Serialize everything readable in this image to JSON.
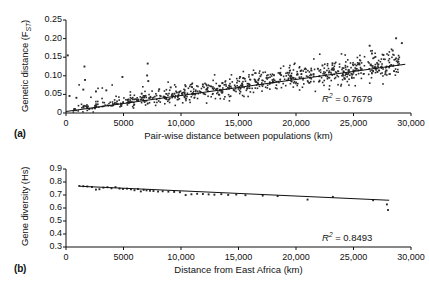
{
  "figure": {
    "panel_a_tag": "(a)",
    "panel_b_tag": "(b)"
  },
  "chart_data": [
    {
      "id": "panel-a",
      "type": "scatter",
      "title": "",
      "xlabel": "Pair-wise distance between populations (km)",
      "ylabel": "Genetic distance (FST)",
      "ylabel_main": "Genetic distance (F",
      "ylabel_sub": "ST",
      "ylabel_tail": ")",
      "xlim": [
        0,
        30000
      ],
      "ylim": [
        0,
        0.25
      ],
      "grid": false,
      "xticks": [
        0,
        5000,
        10000,
        15000,
        20000,
        25000,
        30000
      ],
      "xticklabels": [
        "0",
        "5000",
        "10,000",
        "15,000",
        "20,000",
        "25,000",
        "30,000"
      ],
      "yticks": [
        0,
        0.05,
        0.1,
        0.15,
        0.2,
        0.25
      ],
      "yticklabels": [
        "0",
        "0.05",
        "0.10",
        "0.15",
        "0.20",
        "0.25"
      ],
      "annotation": "R2 = 0.7679",
      "annotation_symbol": "R",
      "annotation_sup": "2",
      "annotation_value": " = 0.7679",
      "r_squared": 0.7679,
      "marker_color": "#2a2a2a",
      "line_color": "#111111",
      "trend": {
        "intercept": 0.004,
        "slope": 4.3e-06,
        "x_start": 0,
        "x_end": 29500
      },
      "n_points": 820,
      "point_spread": 0.016,
      "outliers": [
        [
          150,
          0.155
        ],
        [
          1600,
          0.125
        ],
        [
          1650,
          0.089
        ],
        [
          1500,
          0.063
        ],
        [
          4900,
          0.097
        ],
        [
          7100,
          0.133
        ],
        [
          7050,
          0.101
        ],
        [
          7150,
          0.086
        ],
        [
          2600,
          0.058
        ],
        [
          3500,
          0.061
        ],
        [
          300,
          0.046
        ],
        [
          900,
          0.041
        ],
        [
          26400,
          0.181
        ],
        [
          28700,
          0.201
        ],
        [
          29200,
          0.188
        ],
        [
          28400,
          0.168
        ],
        [
          26600,
          0.16
        ],
        [
          27600,
          0.156
        ],
        [
          26900,
          0.151
        ],
        [
          28900,
          0.145
        ],
        [
          22300,
          0.128
        ],
        [
          21900,
          0.119
        ],
        [
          20400,
          0.113
        ],
        [
          24500,
          0.104
        ],
        [
          18700,
          0.102
        ],
        [
          16900,
          0.099
        ],
        [
          15400,
          0.094
        ],
        [
          13600,
          0.081
        ],
        [
          11900,
          0.077
        ],
        [
          10400,
          0.072
        ],
        [
          9100,
          0.069
        ],
        [
          8100,
          0.064
        ]
      ]
    },
    {
      "id": "panel-b",
      "type": "scatter",
      "title": "",
      "xlabel": "Distance from East Africa (km)",
      "ylabel": "Gene diversity (Hs)",
      "xlim": [
        0,
        30000
      ],
      "ylim": [
        0.3,
        0.9
      ],
      "grid": false,
      "xticks": [
        0,
        5000,
        10000,
        15000,
        20000,
        25000,
        30000
      ],
      "xticklabels": [
        "0",
        "5000",
        "10,000",
        "15,000",
        "20,000",
        "25,000",
        "30,000"
      ],
      "yticks": [
        0.3,
        0.4,
        0.5,
        0.6,
        0.7,
        0.8,
        0.9
      ],
      "yticklabels": [
        "0.3",
        "0.4",
        "0.5",
        "0.6",
        "0.7",
        "0.8",
        "0.9"
      ],
      "annotation": "R2 = 0.8493",
      "annotation_symbol": "R",
      "annotation_sup": "2",
      "annotation_value": " = 0.8493",
      "r_squared": 0.8493,
      "marker_color": "#2a2a2a",
      "line_color": "#111111",
      "trend": {
        "intercept": 0.772,
        "slope": -4e-06,
        "x_start": 1200,
        "x_end": 28100
      },
      "points": [
        [
          1150,
          0.77
        ],
        [
          1500,
          0.768
        ],
        [
          1850,
          0.766
        ],
        [
          2250,
          0.762
        ],
        [
          2600,
          0.742
        ],
        [
          2900,
          0.745
        ],
        [
          3250,
          0.757
        ],
        [
          3600,
          0.76
        ],
        [
          3950,
          0.752
        ],
        [
          4300,
          0.761
        ],
        [
          4650,
          0.75
        ],
        [
          4950,
          0.747
        ],
        [
          5300,
          0.749
        ],
        [
          5650,
          0.744
        ],
        [
          5950,
          0.737
        ],
        [
          6250,
          0.746
        ],
        [
          6500,
          0.728
        ],
        [
          6750,
          0.74
        ],
        [
          7000,
          0.736
        ],
        [
          7300,
          0.733
        ],
        [
          7600,
          0.731
        ],
        [
          8000,
          0.727
        ],
        [
          8400,
          0.729
        ],
        [
          8900,
          0.726
        ],
        [
          9400,
          0.724
        ],
        [
          9900,
          0.722
        ],
        [
          10400,
          0.7
        ],
        [
          10900,
          0.706
        ],
        [
          11400,
          0.71
        ],
        [
          11900,
          0.708
        ],
        [
          12400,
          0.705
        ],
        [
          12900,
          0.703
        ],
        [
          13500,
          0.707
        ],
        [
          14100,
          0.701
        ],
        [
          14800,
          0.704
        ],
        [
          15600,
          0.699
        ],
        [
          17100,
          0.696
        ],
        [
          18400,
          0.692
        ],
        [
          21000,
          0.665
        ],
        [
          23200,
          0.686
        ],
        [
          26700,
          0.66
        ],
        [
          27900,
          0.628
        ],
        [
          28000,
          0.585
        ]
      ]
    }
  ]
}
